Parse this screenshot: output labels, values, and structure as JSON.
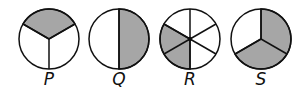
{
  "figures": [
    {
      "label": "P",
      "parts": 3,
      "shaded": 1,
      "description": "top third shaded"
    },
    {
      "label": "Q",
      "parts": 2,
      "shaded": 1,
      "description": "right half shaded"
    },
    {
      "label": "R",
      "parts": 6,
      "shaded": 2,
      "description": "two lower-left sixths shaded"
    },
    {
      "label": "S",
      "parts": 3,
      "shaded": 2,
      "description": "right and bottom thirds shaded"
    }
  ],
  "colors": {
    "shade": "#a6a6a6",
    "stroke": "#111111"
  }
}
